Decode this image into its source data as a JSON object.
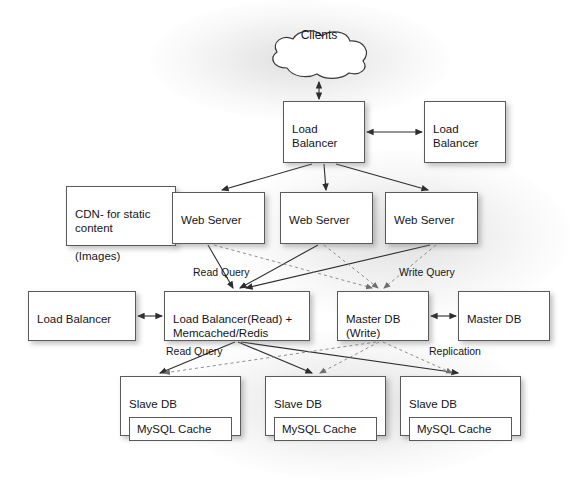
{
  "diagram": {
    "type": "architecture-diagram",
    "colors": {
      "background": "#ffffff",
      "node_fill": "#ffffff",
      "node_border": "#5a5a5a",
      "text": "#15151a",
      "solid_edge": "#3c3c3c",
      "dashed_edge": "#9a9a9a"
    },
    "nodes": {
      "clients": {
        "label": "Clients",
        "shape": "cloud",
        "x": 265,
        "y": 28,
        "w": 108,
        "h": 52
      },
      "load_balancer_primary": {
        "label": "Load\nBalancer",
        "line1": "Load",
        "line2": "Balancer",
        "x": 283,
        "y": 101,
        "w": 82,
        "h": 62
      },
      "load_balancer_secondary": {
        "label": "Load\nBalancer",
        "line1": "Load",
        "line2": "Balancer",
        "x": 424,
        "y": 101,
        "w": 82,
        "h": 62
      },
      "cdn": {
        "line1": "CDN- for static",
        "line2": "content",
        "line3": "(Images)",
        "x": 66,
        "y": 186,
        "w": 110,
        "h": 60
      },
      "web_server_1": {
        "label": "Web Server",
        "x": 172,
        "y": 192,
        "w": 93,
        "h": 52
      },
      "web_server_2": {
        "label": "Web Server",
        "x": 280,
        "y": 192,
        "w": 93,
        "h": 52
      },
      "web_server_3": {
        "label": "Web Server",
        "x": 385,
        "y": 192,
        "w": 93,
        "h": 52
      },
      "load_balancer_left": {
        "label": "Load Balancer",
        "x": 28,
        "y": 291,
        "w": 108,
        "h": 50
      },
      "load_balancer_read_cache": {
        "line1": "Load Balancer(Read) +",
        "line2": "Memcached/Redis",
        "x": 164,
        "y": 291,
        "w": 146,
        "h": 50
      },
      "master_db_write": {
        "line1": "Master DB",
        "line2": "(Write)",
        "x": 337,
        "y": 291,
        "w": 92,
        "h": 50
      },
      "master_db_replica": {
        "label": "Master DB",
        "x": 458,
        "y": 291,
        "w": 92,
        "h": 50
      },
      "slave_db_1": {
        "label": "Slave DB",
        "cache_label": "MySQL Cache",
        "x": 120,
        "y": 376,
        "w": 121,
        "h": 60
      },
      "slave_db_2": {
        "label": "Slave DB",
        "cache_label": "MySQL Cache",
        "x": 265,
        "y": 376,
        "w": 121,
        "h": 60
      },
      "slave_db_3": {
        "label": "Slave DB",
        "cache_label": "MySQL Cache",
        "x": 400,
        "y": 376,
        "w": 121,
        "h": 60
      }
    },
    "edge_labels": {
      "read_query_top": {
        "text": "Read Query",
        "x": 193,
        "y": 266
      },
      "write_query": {
        "text": "Write Query",
        "x": 399,
        "y": 266
      },
      "read_query_bottom": {
        "text": "Read Query",
        "x": 166,
        "y": 345
      },
      "replication": {
        "text": "Replication",
        "x": 429,
        "y": 345
      }
    },
    "connections": [
      {
        "from": "clients",
        "to": "load_balancer_primary",
        "style": "solid",
        "arrows": "both"
      },
      {
        "from": "load_balancer_primary",
        "to": "load_balancer_secondary",
        "style": "solid",
        "arrows": "both"
      },
      {
        "from": "load_balancer_primary",
        "to": "web_server_1",
        "style": "solid",
        "arrows": "to"
      },
      {
        "from": "load_balancer_primary",
        "to": "web_server_2",
        "style": "solid",
        "arrows": "to"
      },
      {
        "from": "load_balancer_primary",
        "to": "web_server_3",
        "style": "solid",
        "arrows": "to"
      },
      {
        "from": "web_server_1",
        "to": "load_balancer_read_cache",
        "style": "solid",
        "arrows": "to",
        "label": "Read Query"
      },
      {
        "from": "web_server_2",
        "to": "load_balancer_read_cache",
        "style": "solid",
        "arrows": "to"
      },
      {
        "from": "web_server_3",
        "to": "load_balancer_read_cache",
        "style": "solid",
        "arrows": "to"
      },
      {
        "from": "web_server_1",
        "to": "master_db_write",
        "style": "dashed",
        "arrows": "to",
        "label": "Write Query"
      },
      {
        "from": "web_server_2",
        "to": "master_db_write",
        "style": "dashed",
        "arrows": "to"
      },
      {
        "from": "web_server_3",
        "to": "master_db_write",
        "style": "dashed",
        "arrows": "to"
      },
      {
        "from": "load_balancer_left",
        "to": "load_balancer_read_cache",
        "style": "solid",
        "arrows": "both"
      },
      {
        "from": "master_db_write",
        "to": "master_db_replica",
        "style": "solid",
        "arrows": "both"
      },
      {
        "from": "load_balancer_read_cache",
        "to": "slave_db_1",
        "style": "solid",
        "arrows": "to",
        "label": "Read Query"
      },
      {
        "from": "load_balancer_read_cache",
        "to": "slave_db_2",
        "style": "solid",
        "arrows": "to"
      },
      {
        "from": "load_balancer_read_cache",
        "to": "slave_db_3",
        "style": "solid",
        "arrows": "to"
      },
      {
        "from": "master_db_write",
        "to": "slave_db_1",
        "style": "dashed",
        "arrows": "to",
        "label": "Replication"
      },
      {
        "from": "master_db_write",
        "to": "slave_db_2",
        "style": "dashed",
        "arrows": "to"
      },
      {
        "from": "master_db_write",
        "to": "slave_db_3",
        "style": "dashed",
        "arrows": "to"
      }
    ]
  }
}
